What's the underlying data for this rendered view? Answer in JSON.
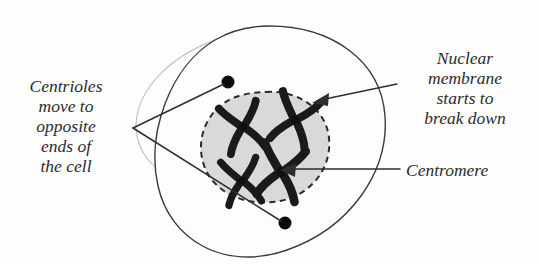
{
  "diagram": {
    "background_color": "#fefefe",
    "cell": {
      "membrane_color": "#3a3a3a",
      "fill_color": "#fdfdfd",
      "ghost_outline_color": "#c3c3c3"
    },
    "nucleus": {
      "fill_color": "#d9d9d9",
      "border_color": "#2a2a2a",
      "border_style": "dashed"
    },
    "chromosome_color": "#1a1a1a",
    "centromere_color": "#101010",
    "centriole_color": "#0c0c0c"
  },
  "labels": {
    "centrioles": {
      "name": "centrioles-label",
      "lines": [
        "Centrioles",
        "move to",
        "opposite",
        "ends of",
        "the cell"
      ],
      "align": "center",
      "leader": "two lines from text vertex to each centriole"
    },
    "nuclear_membrane": {
      "name": "nuclear-membrane-label",
      "lines": [
        "Nuclear",
        "membrane",
        "starts to",
        "break down"
      ],
      "align": "center",
      "leader": "arrow pointing to nuclear envelope"
    },
    "centromere": {
      "name": "centromere-label",
      "lines": [
        "Centromere"
      ],
      "align": "left",
      "leader": "arrow pointing to chromosome centromere"
    }
  },
  "structures": {
    "centrioles": [
      {
        "name": "centriole-top",
        "cx": 228,
        "cy": 82,
        "r": 6.5
      },
      {
        "name": "centriole-bottom",
        "cx": 285,
        "cy": 223,
        "r": 6.5
      }
    ],
    "chromosomes": [
      {
        "name": "chromosome-upper-left",
        "cx": 243,
        "cy": 127,
        "rotation": -12
      },
      {
        "name": "chromosome-upper-right",
        "cx": 295,
        "cy": 120,
        "rotation": 18
      },
      {
        "name": "chromosome-lower-left",
        "cx": 242,
        "cy": 181,
        "rotation": -8
      },
      {
        "name": "chromosome-lower-right",
        "cx": 281,
        "cy": 172,
        "rotation": 12
      }
    ]
  }
}
